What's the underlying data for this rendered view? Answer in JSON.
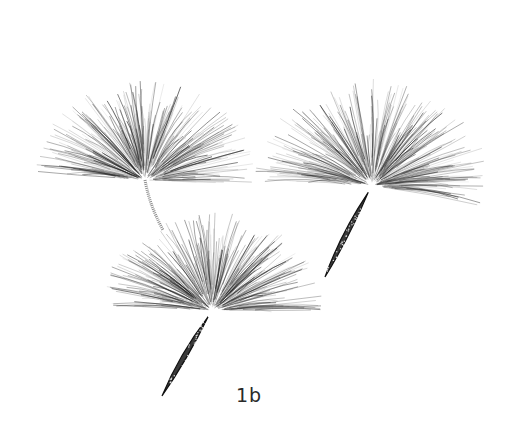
{
  "figure": {
    "label": "1b",
    "background": "#ffffff",
    "ink_color": "#1e1e1e"
  },
  "seeds": [
    {
      "name": "seed-top-left",
      "center": [
        145,
        180
      ],
      "radius": 112,
      "spread_deg": [
        -175,
        5
      ],
      "stalk_end": [
        163,
        230
      ],
      "achene": false
    },
    {
      "name": "seed-bottom",
      "center": [
        212,
        310
      ],
      "radius": 112,
      "spread_deg": [
        -178,
        2
      ],
      "stalk_end": [
        162,
        396
      ],
      "achene": true
    },
    {
      "name": "seed-right",
      "center": [
        372,
        185
      ],
      "radius": 118,
      "spread_deg": [
        -178,
        12
      ],
      "stalk_end": [
        325,
        277
      ],
      "achene": true
    }
  ]
}
